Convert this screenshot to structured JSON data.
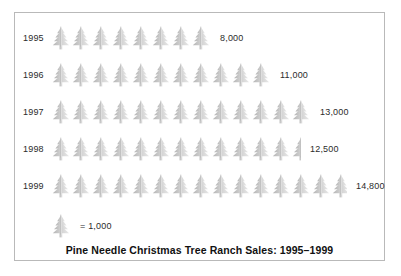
{
  "chart_data": {
    "type": "bar",
    "subtype": "pictograph",
    "title": "Pine Needle Christmas Tree Ranch Sales: 1995–1999",
    "xlabel": "",
    "ylabel": "",
    "unit_label": "= 1,000",
    "unit_value": 1000,
    "icon": "christmas-tree-icon",
    "categories": [
      "1995",
      "1996",
      "1997",
      "1998",
      "1999"
    ],
    "values": [
      8000,
      11000,
      13000,
      12500,
      14800
    ],
    "value_labels": [
      "8,000",
      "11,000",
      "13,000",
      "12,500",
      "14,800"
    ],
    "icon_counts": [
      8,
      11,
      13,
      12.5,
      14.8
    ],
    "rows": [
      {
        "year": "1995",
        "value": 8000,
        "value_label": "8,000",
        "full_icons": 8,
        "partial": 0
      },
      {
        "year": "1996",
        "value": 11000,
        "value_label": "11,000",
        "full_icons": 11,
        "partial": 0
      },
      {
        "year": "1997",
        "value": 13000,
        "value_label": "13,000",
        "full_icons": 13,
        "partial": 0
      },
      {
        "year": "1998",
        "value": 12500,
        "value_label": "12,500",
        "full_icons": 12,
        "partial": 0.5
      },
      {
        "year": "1999",
        "value": 14800,
        "value_label": "14,800",
        "full_icons": 14,
        "partial": 0.8
      }
    ],
    "colors": {
      "icon_light": "#e8e8e8",
      "icon_mid": "#cfcfcf",
      "icon_dark": "#b4b4b4",
      "text": "#2b2b2b",
      "title": "#111111",
      "border": "#b9b9b9",
      "background": "#ffffff"
    },
    "grid": false,
    "legend_position": "bottom-left"
  }
}
